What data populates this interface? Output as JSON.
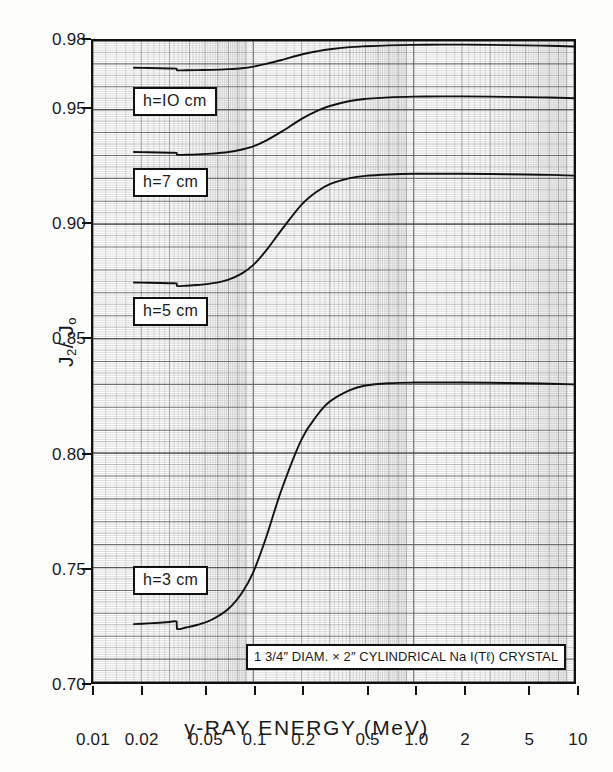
{
  "chart_data": {
    "type": "line",
    "title": "",
    "xlabel": "γ-RAY ENERGY (MeV)",
    "ylabel": "J2/Jo",
    "xscale": "log",
    "xlim": [
      0.01,
      10
    ],
    "ylim": [
      0.7,
      0.98
    ],
    "grid": true,
    "grid_style": "log-log graph paper, fine minor mesh",
    "legend_position": "inline-callouts",
    "xticks": [
      "0.01",
      "0.02",
      "0.05",
      "0.1",
      "0.2",
      "0.5",
      "1.0",
      "2",
      "5",
      "10"
    ],
    "xtick_values": [
      0.01,
      0.02,
      0.05,
      0.1,
      0.2,
      0.5,
      1.0,
      2,
      5,
      10
    ],
    "yticks": [
      "0.98",
      "0.95",
      "0.90",
      "0.85",
      "0.80",
      "0.75",
      "0.70"
    ],
    "ytick_values": [
      0.98,
      0.95,
      0.9,
      0.85,
      0.8,
      0.75,
      0.7
    ],
    "annotations": [
      {
        "text": "1 3/4\" DIAM. × 2\" CYLINDRICAL  Na I(Tℓ) CRYSTAL",
        "x": 0.09,
        "y": 0.722
      }
    ],
    "series": [
      {
        "name": "h=10 cm",
        "label": "h=IO  cm",
        "color": "#111111",
        "x": [
          0.018,
          0.022,
          0.026,
          0.03,
          0.0332,
          0.0334,
          0.038,
          0.045,
          0.055,
          0.07,
          0.085,
          0.1,
          0.12,
          0.15,
          0.2,
          0.25,
          0.3,
          0.4,
          0.5,
          0.7,
          1.0,
          1.5,
          2.0,
          3.0,
          5.0,
          7.0,
          10.0
        ],
        "y": [
          0.9683,
          0.9682,
          0.9681,
          0.968,
          0.9679,
          0.9672,
          0.9672,
          0.9673,
          0.9674,
          0.9677,
          0.9681,
          0.9688,
          0.97,
          0.9717,
          0.9741,
          0.9755,
          0.9764,
          0.9773,
          0.9777,
          0.9781,
          0.9783,
          0.9784,
          0.9784,
          0.9783,
          0.9781,
          0.9779,
          0.9776
        ]
      },
      {
        "name": "h=7 cm",
        "label": "h=7  cm",
        "color": "#111111",
        "x": [
          0.018,
          0.022,
          0.026,
          0.03,
          0.0332,
          0.0334,
          0.038,
          0.045,
          0.055,
          0.07,
          0.085,
          0.1,
          0.12,
          0.15,
          0.2,
          0.25,
          0.3,
          0.4,
          0.5,
          0.7,
          1.0,
          1.5,
          2.0,
          3.0,
          5.0,
          7.0,
          10.0
        ],
        "y": [
          0.9315,
          0.9314,
          0.9313,
          0.9312,
          0.9311,
          0.9303,
          0.9303,
          0.9305,
          0.9308,
          0.9315,
          0.9326,
          0.934,
          0.9365,
          0.9404,
          0.946,
          0.9495,
          0.9516,
          0.9538,
          0.9547,
          0.9554,
          0.9557,
          0.9558,
          0.9558,
          0.9557,
          0.9555,
          0.9553,
          0.955
        ]
      },
      {
        "name": "h=5 cm",
        "label": "h=5  cm",
        "color": "#111111",
        "x": [
          0.018,
          0.022,
          0.026,
          0.03,
          0.0332,
          0.0334,
          0.038,
          0.045,
          0.055,
          0.07,
          0.085,
          0.1,
          0.12,
          0.15,
          0.2,
          0.25,
          0.3,
          0.4,
          0.5,
          0.7,
          1.0,
          1.5,
          2.0,
          3.0,
          5.0,
          7.0,
          10.0
        ],
        "y": [
          0.8745,
          0.8744,
          0.8743,
          0.8742,
          0.8741,
          0.873,
          0.8731,
          0.8734,
          0.8741,
          0.8758,
          0.8785,
          0.8822,
          0.8884,
          0.8975,
          0.9085,
          0.9143,
          0.9175,
          0.9201,
          0.9211,
          0.9217,
          0.922,
          0.922,
          0.922,
          0.9219,
          0.9217,
          0.9215,
          0.9212
        ]
      },
      {
        "name": "h=3 cm",
        "label": "h=3  cm",
        "color": "#111111",
        "x": [
          0.018,
          0.022,
          0.026,
          0.03,
          0.0332,
          0.0334,
          0.038,
          0.045,
          0.055,
          0.07,
          0.085,
          0.1,
          0.12,
          0.15,
          0.2,
          0.25,
          0.3,
          0.4,
          0.5,
          0.7,
          1.0,
          1.5,
          2.0,
          3.0,
          5.0,
          7.0,
          10.0
        ],
        "y": [
          0.7253,
          0.7256,
          0.7259,
          0.7262,
          0.7264,
          0.7232,
          0.7238,
          0.725,
          0.7272,
          0.732,
          0.739,
          0.748,
          0.763,
          0.784,
          0.806,
          0.8165,
          0.8225,
          0.8275,
          0.8295,
          0.8305,
          0.8308,
          0.8308,
          0.8308,
          0.8307,
          0.8305,
          0.8303,
          0.83
        ]
      }
    ],
    "callouts": [
      {
        "label": "h=IO  cm",
        "left": 133,
        "top": 87
      },
      {
        "label": "h=7  cm",
        "left": 133,
        "top": 168
      },
      {
        "label": "h=5  cm",
        "left": 133,
        "top": 297
      },
      {
        "label": "h=3  cm",
        "left": 133,
        "top": 566
      }
    ]
  },
  "axes": {
    "y_title_main": "J",
    "y_title_sub1": "2",
    "y_title_slash": "/ J",
    "y_title_sub2": "o",
    "x_title": "γ-RAY ENERGY (MeV)"
  },
  "crystal_note": {
    "part1": "1 3/4",
    "quote1": "″",
    "part2": " DIAM. × 2",
    "quote2": "″",
    "part3": " CYLINDRICAL  Na I(Tℓ) CRYSTAL",
    "full": "1 3/4″ DIAM. × 2″ CYLINDRICAL  Na I(Tℓ) CRYSTAL"
  },
  "colors": {
    "curve": "#111111",
    "frame": "#111111",
    "grid_minor": "#b9b9b9",
    "grid_major": "#6e6e6e",
    "background": "#ffffff"
  }
}
